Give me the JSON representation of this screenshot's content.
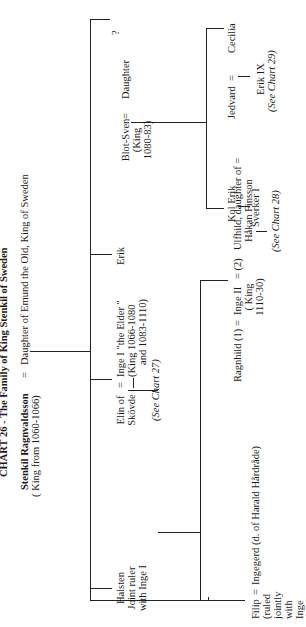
{
  "title": "CHART 26 - The Family of King Stenkil of Sweden",
  "generation1": {
    "husband": "Stenkil Ragnvaldsson",
    "husband_note": "( King from 1060-1066)",
    "equals": "=",
    "wife": "Daughter of Emund the Old, King of Sweden"
  },
  "generation2": {
    "halsten": {
      "name": "Halsten",
      "line2": "Joint ruler",
      "line3": "with Inge I"
    },
    "inge1": {
      "spouse_line1": "Elin of",
      "spouse_line2": "Skövde",
      "equals": "=",
      "name": "Inge I  \"the Elder \"",
      "note1": "(King 1066-1080",
      "note2": "and 1083-1110)",
      "ref": "(See Chart 27)"
    },
    "erik": {
      "name": "Erik"
    },
    "daughter": {
      "question": "?",
      "name": "Daughter",
      "equals": "=",
      "spouse": "Blot-Sven",
      "note1": "(King",
      "note2": "1080-83)"
    }
  },
  "generation3": {
    "filip": {
      "name": "Filip",
      "note": [
        "(ruled",
        "jointly",
        "with",
        "Inge",
        "II)"
      ],
      "equals": "=",
      "spouse": "Ingegerd  (d. of Harald Hårdråde)"
    },
    "inge2": {
      "spouse1": "Ragnhild (1) =",
      "name": "Inge II",
      "equals2": "=  (2)",
      "spouse2_line1": "Ulfhild, daughter of =",
      "spouse2_line2": "Håkan Finsson",
      "note1": "( King",
      "note2": "1110-30)"
    },
    "kol_erik": {
      "name": "Kol Erik"
    },
    "jedvard": {
      "name": "Jedvard",
      "equals": "=",
      "spouse": "Cecilia"
    }
  },
  "generation4": {
    "sverker": {
      "name": "Sverker I",
      "ref": "(See Chart 28)"
    },
    "erik9": {
      "name": "Erik IX",
      "ref": "(See Chart 29)"
    }
  }
}
